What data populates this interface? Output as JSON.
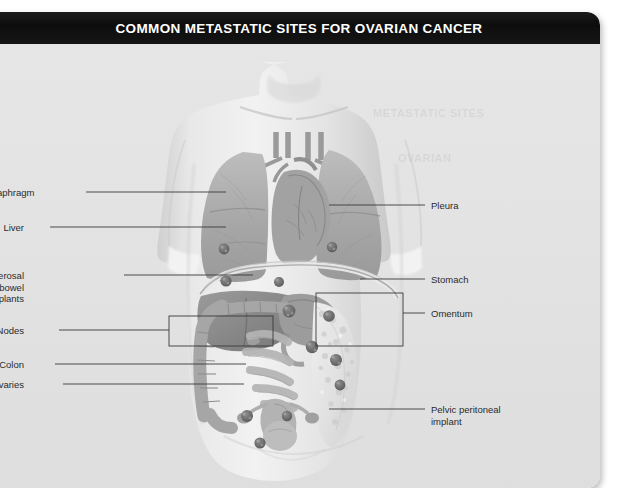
{
  "figure": {
    "title": "COMMON METASTATIC SITES FOR OVARIAN CANCER",
    "style": "grayscale-medical-illustration",
    "colors": {
      "title_bar": "#101010",
      "title_text": "#ffffff",
      "card_background": "#e3e3e3",
      "page_background": "#ffffff",
      "leader_line": "#3a3a3a",
      "label_text": "#2b2b2b",
      "skin": "#dcdcdc",
      "lung": "#b0b0b0",
      "liver": "#8f8f8f",
      "bowel": "#c9c9c9",
      "omentum": "#e8e8e8",
      "tumor_implant": "#6e6e6e"
    }
  },
  "labels_left": [
    {
      "id": "diaphragm",
      "text": "Diaphragm",
      "x": 36,
      "y": 175,
      "line_from_x": 98,
      "line_to_x": 238,
      "line_y": 180
    },
    {
      "id": "liver",
      "text": "Liver",
      "x": 36,
      "y": 210,
      "line_from_x": 62,
      "line_to_x": 238,
      "line_y": 215
    },
    {
      "id": "serosal-bowel-implants",
      "text": "Serosal bowel implants",
      "x": 36,
      "y": 258,
      "line_from_x": 136,
      "line_to_x": 265,
      "line_y": 263
    },
    {
      "id": "nodes",
      "text": "Nodes",
      "x": 36,
      "y": 313,
      "line_from_x": 71,
      "line_to_x": 181,
      "line_y": 318
    },
    {
      "id": "colon",
      "text": "Colon",
      "x": 36,
      "y": 347,
      "line_from_x": 67,
      "line_to_x": 258,
      "line_y": 352
    },
    {
      "id": "ovaries",
      "text": "Ovaries",
      "x": 36,
      "y": 367,
      "line_from_x": 75,
      "line_to_x": 256,
      "line_y": 372
    }
  ],
  "labels_right": [
    {
      "id": "pleura",
      "text": "Pleura",
      "x": 443,
      "y": 188,
      "line_from_x": 341,
      "line_to_x": 437,
      "line_y": 193
    },
    {
      "id": "stomach",
      "text": "Stomach",
      "x": 443,
      "y": 262,
      "line_from_x": 372,
      "line_to_x": 437,
      "line_y": 267
    },
    {
      "id": "omentum",
      "text": "Omentum",
      "x": 443,
      "y": 296,
      "line_from_x": 415,
      "line_to_x": 437,
      "line_y": 301
    },
    {
      "id": "pelvic-peritoneal-implant",
      "text": "Pelvic peritoneal\nimplant",
      "x": 443,
      "y": 392,
      "line_from_x": 341,
      "line_to_x": 437,
      "line_y": 397
    }
  ],
  "callout_boxes": [
    {
      "id": "nodes-box",
      "x": 181,
      "y": 304,
      "width": 104,
      "height": 30
    },
    {
      "id": "omentum-box",
      "x": 328,
      "y": 281,
      "width": 87,
      "height": 53
    }
  ],
  "anatomy_parts": [
    {
      "id": "lung-right",
      "label": "right lung"
    },
    {
      "id": "lung-left",
      "label": "left lung"
    },
    {
      "id": "heart",
      "label": "heart"
    },
    {
      "id": "trachea",
      "label": "trachea and bronchi"
    },
    {
      "id": "diaphragm-arc",
      "label": "diaphragm"
    },
    {
      "id": "liver-organ",
      "label": "liver"
    },
    {
      "id": "stomach-organ",
      "label": "stomach"
    },
    {
      "id": "colon-organ",
      "label": "colon"
    },
    {
      "id": "small-bowel",
      "label": "small bowel"
    },
    {
      "id": "omentum-organ",
      "label": "omentum"
    },
    {
      "id": "uterus",
      "label": "uterus"
    },
    {
      "id": "ovary-left",
      "label": "left ovary"
    },
    {
      "id": "ovary-right",
      "label": "right ovary"
    },
    {
      "id": "bladder",
      "label": "bladder"
    }
  ],
  "tumor_implants": [
    {
      "id": "implant-diaphragm-right",
      "cx": 238,
      "cy": 237
    },
    {
      "id": "implant-diaphragm-left",
      "cx": 291,
      "cy": 238
    },
    {
      "id": "implant-pleura-right",
      "cx": 236,
      "cy": 205
    },
    {
      "id": "implant-pleura-left",
      "cx": 344,
      "cy": 203
    },
    {
      "id": "implant-liver-surface",
      "cx": 301,
      "cy": 267
    },
    {
      "id": "implant-stomach",
      "cx": 313,
      "cy": 265
    },
    {
      "id": "implant-serosal-bowel",
      "cx": 324,
      "cy": 303
    },
    {
      "id": "implant-omentum-upper",
      "cx": 341,
      "cy": 272
    },
    {
      "id": "implant-omentum-mid",
      "cx": 348,
      "cy": 316
    },
    {
      "id": "implant-omentum-lower",
      "cx": 352,
      "cy": 341
    },
    {
      "id": "implant-ovary-right",
      "cx": 259,
      "cy": 372
    },
    {
      "id": "implant-ovary-left",
      "cx": 299,
      "cy": 372
    },
    {
      "id": "implant-pelvic",
      "cx": 272,
      "cy": 399
    }
  ],
  "ghost_artifacts": [
    {
      "text": "METASTATIC SITES",
      "x": 385,
      "y": 95
    },
    {
      "text": "OVARIAN",
      "x": 410,
      "y": 140
    }
  ]
}
